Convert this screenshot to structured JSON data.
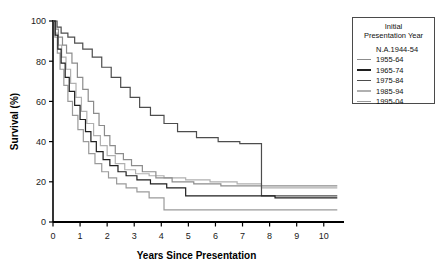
{
  "chart_data": {
    "type": "line",
    "title": "",
    "xlabel": "Years Since Presentation",
    "ylabel": "Survival (%)",
    "xlim": [
      0,
      10.6
    ],
    "ylim": [
      0,
      100
    ],
    "xticks": [
      0,
      1,
      2,
      3,
      4,
      5,
      6,
      7,
      8,
      9,
      10
    ],
    "yticks": [
      0,
      20,
      40,
      60,
      80,
      100
    ],
    "grid": false,
    "legend_position": "top-right",
    "legend_title": "Initial Presentation Year",
    "step_style": "post",
    "series": [
      {
        "name": "N.A. 1944-54",
        "color": "#000000",
        "has_line_marker": false,
        "points": [
          [
            0,
            100
          ]
        ]
      },
      {
        "name": "1955-64",
        "color": "#8c8c8c",
        "has_line_marker": true,
        "points": [
          [
            0,
            100
          ],
          [
            0.1,
            96
          ],
          [
            0.2,
            92
          ],
          [
            0.35,
            88
          ],
          [
            0.5,
            84
          ],
          [
            0.7,
            79
          ],
          [
            0.9,
            72
          ],
          [
            1.1,
            66
          ],
          [
            1.3,
            60
          ],
          [
            1.5,
            54
          ],
          [
            1.7,
            48
          ],
          [
            1.9,
            43
          ],
          [
            2.1,
            38
          ],
          [
            2.3,
            34
          ],
          [
            2.6,
            31
          ],
          [
            2.9,
            28
          ],
          [
            3.3,
            25
          ],
          [
            3.8,
            22
          ],
          [
            4.4,
            20
          ],
          [
            5.2,
            19
          ],
          [
            6.2,
            18
          ],
          [
            7.6,
            18
          ],
          [
            10.5,
            18
          ]
        ]
      },
      {
        "name": "1965-74",
        "color": "#1f1f1f",
        "has_line_marker": true,
        "points": [
          [
            0,
            100
          ],
          [
            0.08,
            93
          ],
          [
            0.18,
            86
          ],
          [
            0.3,
            79
          ],
          [
            0.45,
            72
          ],
          [
            0.6,
            65
          ],
          [
            0.8,
            58
          ],
          [
            1.0,
            51
          ],
          [
            1.2,
            45
          ],
          [
            1.4,
            40
          ],
          [
            1.6,
            35
          ],
          [
            1.85,
            31
          ],
          [
            2.1,
            28
          ],
          [
            2.4,
            25
          ],
          [
            2.7,
            23
          ],
          [
            3.1,
            21
          ],
          [
            3.6,
            19
          ],
          [
            4.2,
            17
          ],
          [
            4.9,
            13
          ],
          [
            6.0,
            13
          ],
          [
            7.7,
            13
          ],
          [
            8.2,
            12
          ],
          [
            10.5,
            12
          ]
        ]
      },
      {
        "name": "1975-84",
        "color": "#4d4d4d",
        "has_line_marker": true,
        "points": [
          [
            0,
            100
          ],
          [
            0.15,
            97
          ],
          [
            0.3,
            94
          ],
          [
            0.55,
            92
          ],
          [
            0.8,
            89
          ],
          [
            1.1,
            86
          ],
          [
            1.45,
            82
          ],
          [
            1.8,
            77
          ],
          [
            2.15,
            72
          ],
          [
            2.5,
            67
          ],
          [
            2.85,
            62
          ],
          [
            3.2,
            57
          ],
          [
            3.6,
            53
          ],
          [
            4.1,
            49
          ],
          [
            4.6,
            45
          ],
          [
            5.3,
            42
          ],
          [
            6.1,
            40
          ],
          [
            6.9,
            39
          ],
          [
            7.65,
            39
          ],
          [
            7.7,
            13
          ],
          [
            10.5,
            13
          ]
        ]
      },
      {
        "name": "1985-94",
        "color": "#b0b0b0",
        "has_line_marker": true,
        "points": [
          [
            0,
            100
          ],
          [
            0.09,
            94
          ],
          [
            0.2,
            88
          ],
          [
            0.32,
            82
          ],
          [
            0.48,
            76
          ],
          [
            0.65,
            69
          ],
          [
            0.85,
            62
          ],
          [
            1.05,
            55
          ],
          [
            1.25,
            49
          ],
          [
            1.5,
            43
          ],
          [
            1.75,
            38
          ],
          [
            2.0,
            33
          ],
          [
            2.3,
            29
          ],
          [
            2.65,
            26
          ],
          [
            3.05,
            24
          ],
          [
            3.55,
            23
          ],
          [
            4.1,
            22
          ],
          [
            4.9,
            21
          ],
          [
            5.8,
            20
          ],
          [
            6.8,
            19
          ],
          [
            7.7,
            17
          ],
          [
            10.5,
            17
          ]
        ]
      },
      {
        "name": "1995-04",
        "color": "#9a9a9a",
        "has_line_marker": true,
        "points": [
          [
            0,
            100
          ],
          [
            0.07,
            92
          ],
          [
            0.16,
            84
          ],
          [
            0.26,
            76
          ],
          [
            0.4,
            68
          ],
          [
            0.55,
            60
          ],
          [
            0.72,
            53
          ],
          [
            0.92,
            46
          ],
          [
            1.12,
            40
          ],
          [
            1.32,
            34
          ],
          [
            1.55,
            29
          ],
          [
            1.8,
            25
          ],
          [
            2.05,
            22
          ],
          [
            2.35,
            19
          ],
          [
            2.7,
            17
          ],
          [
            3.1,
            15
          ],
          [
            3.55,
            12
          ],
          [
            4.1,
            6
          ],
          [
            6.0,
            6
          ],
          [
            8.0,
            6
          ],
          [
            10.5,
            6
          ]
        ]
      }
    ]
  },
  "legend": {
    "title_line1": "Initial",
    "title_line2": "Presentation Year",
    "entries": [
      {
        "label": "N.A.1944-54",
        "color": "#000000",
        "marker": false
      },
      {
        "label": "1955-64",
        "color": "#8c8c8c",
        "marker": true
      },
      {
        "label": "1965-74",
        "color": "#1f1f1f",
        "marker": true
      },
      {
        "label": "1975-84",
        "color": "#4d4d4d",
        "marker": true
      },
      {
        "label": "1985-94",
        "color": "#b0b0b0",
        "marker": true
      },
      {
        "label": "1995-04",
        "color": "#9a9a9a",
        "marker": true
      }
    ]
  }
}
